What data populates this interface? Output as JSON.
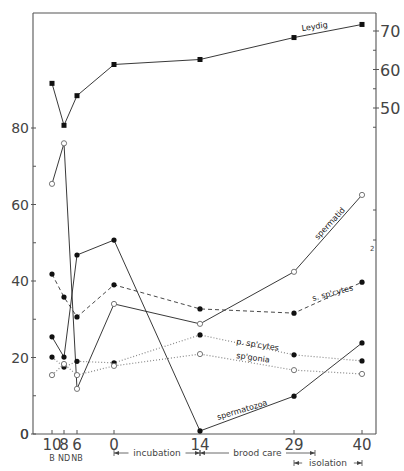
{
  "chart_data": {
    "type": "line",
    "title": "",
    "xlabel": "",
    "ylabel_left": "",
    "ylabel_right": "",
    "x_categories": [
      {
        "tick": "10",
        "sub": "B",
        "x": 52
      },
      {
        "tick": "8",
        "sub": "ND",
        "x": 64
      },
      {
        "tick": "6",
        "sub": "NB",
        "x": 77
      },
      {
        "tick": "0",
        "sub": "",
        "x": 114
      },
      {
        "tick": "14",
        "sub": "",
        "x": 200
      },
      {
        "tick": "29",
        "sub": "",
        "x": 294
      },
      {
        "tick": "40",
        "sub": "",
        "x": 362
      }
    ],
    "left_axis": {
      "ylim": [
        0,
        100
      ],
      "ticks": [
        0,
        20,
        40,
        60,
        80
      ],
      "tick_labels": [
        "0",
        "20",
        "40",
        "60",
        "80"
      ],
      "minor_ticks": [
        10,
        30,
        50,
        70
      ]
    },
    "right_axis": {
      "ylim": [
        36,
        72
      ],
      "ticks": [
        50,
        60,
        70
      ],
      "tick_labels": [
        "50",
        "60",
        "70"
      ],
      "minor_ticks": [
        45,
        55,
        65
      ],
      "annotation": "2"
    },
    "periods": [
      {
        "label": "incubation",
        "from": "0",
        "to": "14"
      },
      {
        "label": "brood care",
        "from": "14",
        "to": "29+"
      },
      {
        "label": "isolation",
        "from": "29",
        "to": "40"
      }
    ],
    "series": [
      {
        "name": "Leydig",
        "axis": "right",
        "marker": "square-filled",
        "line": "solid",
        "values": [
          56.4,
          45.5,
          53.2,
          61.3,
          62.6,
          68.3,
          71.7
        ]
      },
      {
        "name": "spermatid",
        "axis": "left",
        "marker": "circle-open",
        "line": "solid",
        "values": [
          65.4,
          76.0,
          11.8,
          34.0,
          28.8,
          42.4,
          62.5
        ]
      },
      {
        "name": "s. sp'cytes",
        "axis": "left",
        "marker": "circle-filled",
        "line": "dashed",
        "values": [
          41.8,
          35.8,
          30.6,
          39.0,
          32.7,
          31.6,
          39.7
        ]
      },
      {
        "name": "spermatozoa",
        "axis": "left",
        "marker": "circle-filled",
        "line": "solid",
        "values": [
          25.4,
          20.1,
          46.8,
          50.7,
          0.8,
          9.9,
          23.8
        ]
      },
      {
        "name": "p. sp'cytes",
        "axis": "left",
        "marker": "circle-filled",
        "line": "dotted",
        "values": [
          20.1,
          17.5,
          19.0,
          18.6,
          25.9,
          20.7,
          19.1
        ]
      },
      {
        "name": "sp'gonia",
        "axis": "left",
        "marker": "circle-open",
        "line": "dotted",
        "values": [
          15.4,
          18.3,
          15.4,
          17.8,
          20.9,
          16.7,
          15.7
        ]
      }
    ],
    "series_labels": [
      {
        "text": "Leydig",
        "x": 302,
        "y": 31,
        "rotate": -8
      },
      {
        "text": "spermatid",
        "x": 318,
        "y": 240,
        "rotate": -47
      },
      {
        "text": "s. sp'cytes",
        "x": 313,
        "y": 301,
        "rotate": -15
      },
      {
        "text": "p. sp'cytes",
        "x": 236,
        "y": 344,
        "rotate": 9
      },
      {
        "text": "sp'gonia",
        "x": 236,
        "y": 358,
        "rotate": 8
      },
      {
        "text": "spermatozoa",
        "x": 218,
        "y": 420,
        "rotate": -17
      }
    ],
    "grid": false,
    "legend": "inline labels"
  }
}
